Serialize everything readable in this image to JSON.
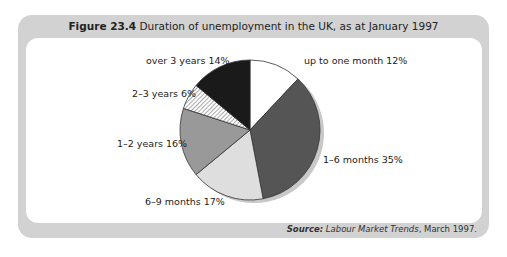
{
  "figure": {
    "number": "Figure 23.4",
    "caption": "Duration of unemployment in the UK, as at January 1997",
    "source_label": "Source:",
    "source_title": "Labour Market Trends",
    "source_date": ", March 1997."
  },
  "chart_data": {
    "type": "pie",
    "title": "Duration of unemployment in the UK, as at January 1997",
    "categories": [
      "up to one month",
      "1–6 months",
      "6–9 months",
      "1–2 years",
      "2–3 years",
      "over 3 years"
    ],
    "values": [
      12,
      35,
      17,
      16,
      6,
      14
    ],
    "unit": "%",
    "labels": [
      "up to one month 12%",
      "1–6 months 35%",
      "6–9 months 17%",
      "1–2 years 16%",
      "2–3 years 6%",
      "over 3 years 14%"
    ],
    "fills": [
      "#ffffff",
      "#555555",
      "#dedede",
      "#999999",
      "hatched",
      "#1a1a1a"
    ],
    "start_angle": "12 o'clock, clockwise",
    "legend": "none (direct labels)",
    "source": "Labour Market Trends, March 1997."
  }
}
